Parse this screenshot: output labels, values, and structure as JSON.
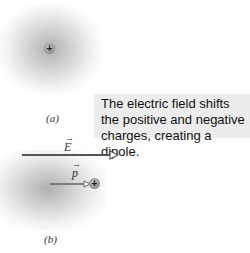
{
  "diagram": {
    "panel_a": {
      "label": "(a)",
      "charge_symbol": "+"
    },
    "panel_b": {
      "label": "(b)",
      "charge_symbol": "+",
      "field_vector_label": "E",
      "dipole_vector_label": "p"
    },
    "callout": {
      "line1": "The electric field shifts",
      "line2": "the positive and negative",
      "line3": "charges, creating a dipole."
    },
    "colors": {
      "arrow": "#555555",
      "callout_bg": "#ececec",
      "cloud": "#9a9a9a"
    }
  }
}
